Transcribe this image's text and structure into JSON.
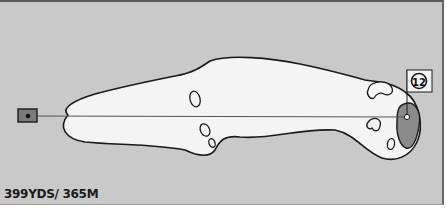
{
  "hole": {
    "number": "12",
    "yardage_label": "399YDS/ 365M",
    "yards": 399,
    "meters": 365
  },
  "colors": {
    "background": "#c9c9c9",
    "fairway": "#f4f4f4",
    "green": "#8a8a8a",
    "outline": "#1a1a1a",
    "tee_box": "#7a7a7a"
  },
  "elements": {
    "tee": "tee-box",
    "fairway": "fairway",
    "green": "green",
    "flag": "flag-pin",
    "bunkers": [
      "bunker-1",
      "bunker-2",
      "bunker-3",
      "bunker-4",
      "bunker-5",
      "bunker-6"
    ],
    "line_of_play": "center-line"
  }
}
